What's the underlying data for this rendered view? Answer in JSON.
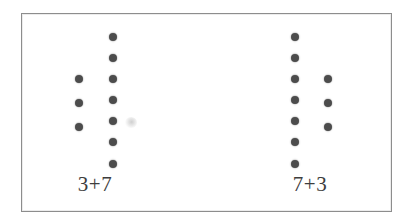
{
  "figure": {
    "kind": "dot-array-addition-diagram",
    "frame": {
      "border_color": "#8d8d8d",
      "background_color": "#ffffff"
    },
    "dot": {
      "color": "#4c4c4c",
      "diameter_px": 8
    },
    "label_color": "#3d3d3d",
    "expressions": [
      {
        "id": "left",
        "label": "3+7",
        "label_x": 95,
        "label_y": 174,
        "columns": [
          {
            "name": "first-addend-column",
            "count": 3,
            "x": 79,
            "dots_y": [
              79,
              103,
              127
            ]
          },
          {
            "name": "second-addend-column",
            "count": 7,
            "x": 113,
            "dots_y": [
              37,
              58,
              79,
              100,
              121,
              142,
              164
            ]
          }
        ]
      },
      {
        "id": "right",
        "label": "7+3",
        "label_x": 310,
        "label_y": 174,
        "columns": [
          {
            "name": "first-addend-column",
            "count": 7,
            "x": 295,
            "dots_y": [
              37,
              58,
              79,
              100,
              121,
              142,
              164
            ]
          },
          {
            "name": "second-addend-column",
            "count": 3,
            "x": 328,
            "dots_y": [
              79,
              103,
              127
            ]
          }
        ]
      }
    ]
  }
}
